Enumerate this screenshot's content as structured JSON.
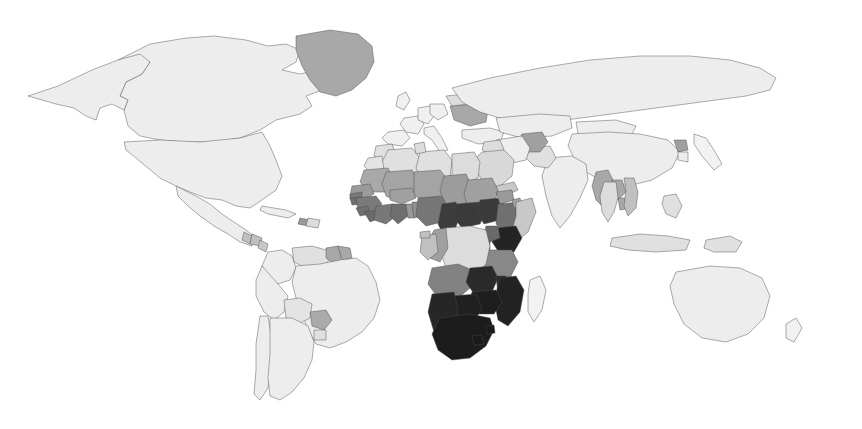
{
  "figure": {
    "kind": "choropleth-world-map",
    "title": "",
    "subtitle": "",
    "legend_visible": false,
    "axis_visible": false,
    "background_color": "#ffffff",
    "border_color": "#4a4a4a",
    "width": 862,
    "height": 429
  },
  "chart_data": {
    "type": "heatmap",
    "title": "",
    "xlabel": "",
    "ylabel": "",
    "projection": "equirectangular",
    "grid": false,
    "legend_position": "none",
    "colorscale_name": "grayscale-sequential-inverted",
    "colorscale": [
      {
        "level": 0,
        "label": "lowest",
        "color": "#ededed"
      },
      {
        "level": 1,
        "label": "low",
        "color": "#dcdcdc"
      },
      {
        "level": 2,
        "label": "medium-low",
        "color": "#c0c0c0"
      },
      {
        "level": 3,
        "label": "medium",
        "color": "#a0a0a0"
      },
      {
        "level": 4,
        "label": "medium-high",
        "color": "#7a7a7a"
      },
      {
        "level": 5,
        "label": "high",
        "color": "#4d4d4d"
      },
      {
        "level": 6,
        "label": "highest",
        "color": "#202020"
      }
    ],
    "no_data_color": "#ffffff",
    "regions": [
      {
        "name": "Canada",
        "level": 0,
        "color": "#ededed"
      },
      {
        "name": "United States",
        "level": 0,
        "color": "#ededed"
      },
      {
        "name": "Alaska",
        "level": 0,
        "color": "#ededed"
      },
      {
        "name": "Greenland",
        "level": 3,
        "color": "#a8a8a8"
      },
      {
        "name": "Mexico",
        "level": 0,
        "color": "#ededed"
      },
      {
        "name": "Guatemala",
        "level": 2,
        "color": "#c0c0c0"
      },
      {
        "name": "Honduras",
        "level": 2,
        "color": "#c0c0c0"
      },
      {
        "name": "Nicaragua",
        "level": 2,
        "color": "#c8c8c8"
      },
      {
        "name": "Cuba",
        "level": 0,
        "color": "#ededed"
      },
      {
        "name": "Haiti",
        "level": 3,
        "color": "#9a9a9a"
      },
      {
        "name": "Dominican Republic",
        "level": 1,
        "color": "#dcdcdc"
      },
      {
        "name": "Colombia",
        "level": 0,
        "color": "#ededed"
      },
      {
        "name": "Venezuela",
        "level": 1,
        "color": "#e0e0e0"
      },
      {
        "name": "Guyana",
        "level": 3,
        "color": "#a8a8a8"
      },
      {
        "name": "Suriname",
        "level": 3,
        "color": "#a8a8a8"
      },
      {
        "name": "Brazil",
        "level": 0,
        "color": "#ededed"
      },
      {
        "name": "Peru",
        "level": 0,
        "color": "#ededed"
      },
      {
        "name": "Bolivia",
        "level": 1,
        "color": "#e4e4e4"
      },
      {
        "name": "Paraguay",
        "level": 3,
        "color": "#aaaaaa"
      },
      {
        "name": "Chile",
        "level": 0,
        "color": "#ededed"
      },
      {
        "name": "Argentina",
        "level": 0,
        "color": "#ededed"
      },
      {
        "name": "Uruguay",
        "level": 1,
        "color": "#e0e0e0"
      },
      {
        "name": "United Kingdom",
        "level": 0,
        "color": "#f0f0f0"
      },
      {
        "name": "France",
        "level": 0,
        "color": "#f0f0f0"
      },
      {
        "name": "Spain",
        "level": 0,
        "color": "#f0f0f0"
      },
      {
        "name": "Germany",
        "level": 0,
        "color": "#f0f0f0"
      },
      {
        "name": "Poland",
        "level": 0,
        "color": "#f0f0f0"
      },
      {
        "name": "Italy",
        "level": 0,
        "color": "#f0f0f0"
      },
      {
        "name": "Ukraine",
        "level": 3,
        "color": "#a8a8a8"
      },
      {
        "name": "Belarus",
        "level": 1,
        "color": "#dcdcdc"
      },
      {
        "name": "Turkey",
        "level": 0,
        "color": "#ededed"
      },
      {
        "name": "Russia",
        "level": 0,
        "color": "#ededed"
      },
      {
        "name": "Kazakhstan",
        "level": 0,
        "color": "#ededed"
      },
      {
        "name": "Mongolia",
        "level": 0,
        "color": "#ededed"
      },
      {
        "name": "China",
        "level": 0,
        "color": "#ededed"
      },
      {
        "name": "North Korea",
        "level": 3,
        "color": "#a0a0a0"
      },
      {
        "name": "South Korea",
        "level": 0,
        "color": "#ededed"
      },
      {
        "name": "Japan",
        "level": 0,
        "color": "#f2f2f2"
      },
      {
        "name": "India",
        "level": 0,
        "color": "#ededed"
      },
      {
        "name": "Pakistan",
        "level": 1,
        "color": "#e0e0e0"
      },
      {
        "name": "Afghanistan",
        "level": 3,
        "color": "#a0a0a0"
      },
      {
        "name": "Iran",
        "level": 0,
        "color": "#ededed"
      },
      {
        "name": "Iraq",
        "level": 1,
        "color": "#dcdcdc"
      },
      {
        "name": "Saudi Arabia",
        "level": 1,
        "color": "#d8d8d8"
      },
      {
        "name": "Yemen",
        "level": 2,
        "color": "#c8c8c8"
      },
      {
        "name": "Myanmar",
        "level": 3,
        "color": "#a8a8a8"
      },
      {
        "name": "Laos",
        "level": 3,
        "color": "#a8a8a8"
      },
      {
        "name": "Cambodia",
        "level": 3,
        "color": "#a8a8a8"
      },
      {
        "name": "Thailand",
        "level": 1,
        "color": "#dcdcdc"
      },
      {
        "name": "Vietnam",
        "level": 2,
        "color": "#c0c0c0"
      },
      {
        "name": "Indonesia",
        "level": 1,
        "color": "#e0e0e0"
      },
      {
        "name": "Philippines",
        "level": 1,
        "color": "#e0e0e0"
      },
      {
        "name": "Papua New Guinea",
        "level": 1,
        "color": "#e0e0e0"
      },
      {
        "name": "Australia",
        "level": 0,
        "color": "#ededed"
      },
      {
        "name": "New Zealand",
        "level": 0,
        "color": "#f2f2f2"
      },
      {
        "name": "Morocco",
        "level": 1,
        "color": "#e0e0e0"
      },
      {
        "name": "Algeria",
        "level": 1,
        "color": "#e0e0e0"
      },
      {
        "name": "Libya",
        "level": 1,
        "color": "#e0e0e0"
      },
      {
        "name": "Egypt",
        "level": 1,
        "color": "#dcdcdc"
      },
      {
        "name": "Tunisia",
        "level": 1,
        "color": "#dcdcdc"
      },
      {
        "name": "Western Sahara",
        "level": 1,
        "color": "#e4e4e4"
      },
      {
        "name": "Mauritania",
        "level": 3,
        "color": "#a8a8a8"
      },
      {
        "name": "Mali",
        "level": 3,
        "color": "#a4a4a4"
      },
      {
        "name": "Niger",
        "level": 3,
        "color": "#a4a4a4"
      },
      {
        "name": "Chad",
        "level": 3,
        "color": "#9c9c9c"
      },
      {
        "name": "Sudan",
        "level": 3,
        "color": "#a0a0a0"
      },
      {
        "name": "Senegal",
        "level": 3,
        "color": "#9a9a9a"
      },
      {
        "name": "Gambia",
        "level": 4,
        "color": "#7a7a7a"
      },
      {
        "name": "Guinea-Bissau",
        "level": 4,
        "color": "#6e6e6e"
      },
      {
        "name": "Guinea",
        "level": 4,
        "color": "#7a7a7a"
      },
      {
        "name": "Sierra Leone",
        "level": 4,
        "color": "#707070"
      },
      {
        "name": "Liberia",
        "level": 4,
        "color": "#6a6a6a"
      },
      {
        "name": "Cote d'Ivoire",
        "level": 4,
        "color": "#787878"
      },
      {
        "name": "Ghana",
        "level": 4,
        "color": "#6e6e6e"
      },
      {
        "name": "Togo",
        "level": 3,
        "color": "#999999"
      },
      {
        "name": "Benin",
        "level": 3,
        "color": "#909090"
      },
      {
        "name": "Burkina Faso",
        "level": 3,
        "color": "#a0a0a0"
      },
      {
        "name": "Nigeria",
        "level": 4,
        "color": "#767676"
      },
      {
        "name": "Cameroon",
        "level": 5,
        "color": "#3c3c3c"
      },
      {
        "name": "Central African Republic",
        "level": 5,
        "color": "#3a3a3a"
      },
      {
        "name": "South Sudan",
        "level": 5,
        "color": "#3a3a3a"
      },
      {
        "name": "Ethiopia",
        "level": 4,
        "color": "#707070"
      },
      {
        "name": "Eritrea",
        "level": 3,
        "color": "#9a9a9a"
      },
      {
        "name": "Djibouti",
        "level": 3,
        "color": "#a0a0a0"
      },
      {
        "name": "Somalia",
        "level": 2,
        "color": "#c8c8c8"
      },
      {
        "name": "Kenya",
        "level": 6,
        "color": "#242424"
      },
      {
        "name": "Uganda",
        "level": 4,
        "color": "#6a6a6a"
      },
      {
        "name": "Rwanda",
        "level": 4,
        "color": "#6a6a6a"
      },
      {
        "name": "Burundi",
        "level": 4,
        "color": "#6a6a6a"
      },
      {
        "name": "Tanzania",
        "level": 4,
        "color": "#888888"
      },
      {
        "name": "Democratic Republic of the Congo",
        "level": 1,
        "color": "#dcdcdc"
      },
      {
        "name": "Republic of the Congo",
        "level": 3,
        "color": "#a0a0a0"
      },
      {
        "name": "Gabon",
        "level": 2,
        "color": "#c0c0c0"
      },
      {
        "name": "Equatorial Guinea",
        "level": 2,
        "color": "#c0c0c0"
      },
      {
        "name": "Angola",
        "level": 4,
        "color": "#828282"
      },
      {
        "name": "Zambia",
        "level": 6,
        "color": "#2a2a2a"
      },
      {
        "name": "Malawi",
        "level": 6,
        "color": "#2a2a2a"
      },
      {
        "name": "Mozambique",
        "level": 6,
        "color": "#222222"
      },
      {
        "name": "Zimbabwe",
        "level": 6,
        "color": "#1e1e1e"
      },
      {
        "name": "Botswana",
        "level": 6,
        "color": "#202020"
      },
      {
        "name": "Namibia",
        "level": 6,
        "color": "#262626"
      },
      {
        "name": "South Africa",
        "level": 6,
        "color": "#1c1c1c"
      },
      {
        "name": "Lesotho",
        "level": 6,
        "color": "#1a1a1a"
      },
      {
        "name": "Eswatini",
        "level": 6,
        "color": "#1a1a1a"
      },
      {
        "name": "Madagascar",
        "level": 0,
        "color": "#f2f2f2"
      }
    ]
  }
}
